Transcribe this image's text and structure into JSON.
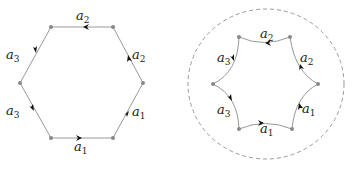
{
  "figures": [
    {
      "name": "hexagon",
      "labels": [
        {
          "base": "a",
          "sub": "2",
          "x": 76,
          "y": 20
        },
        {
          "base": "a",
          "sub": "2",
          "x": 132,
          "y": 59
        },
        {
          "base": "a",
          "sub": "1",
          "x": 132,
          "y": 116
        },
        {
          "base": "a",
          "sub": "1",
          "x": 74,
          "y": 151
        },
        {
          "base": "a",
          "sub": "3",
          "x": 6,
          "y": 115
        },
        {
          "base": "a",
          "sub": "3",
          "x": 6,
          "y": 59
        }
      ]
    },
    {
      "name": "curved-hexagon-in-circle",
      "labels": [
        {
          "base": "a",
          "sub": "2",
          "x": 260,
          "y": 38
        },
        {
          "base": "a",
          "sub": "2",
          "x": 300,
          "y": 62
        },
        {
          "base": "a",
          "sub": "1",
          "x": 302,
          "y": 113
        },
        {
          "base": "a",
          "sub": "1",
          "x": 260,
          "y": 133
        },
        {
          "base": "a",
          "sub": "3",
          "x": 217,
          "y": 114
        },
        {
          "base": "a",
          "sub": "3",
          "x": 217,
          "y": 62
        }
      ]
    }
  ]
}
